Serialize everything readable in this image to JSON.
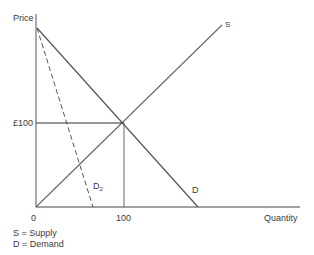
{
  "diagram": {
    "y_axis_label": "Price",
    "x_axis_label": "Quantity",
    "price_tick": "£100",
    "quantity_tick": "100",
    "origin": "0",
    "curves": {
      "supply": "S",
      "demand": "D",
      "demand2_main": "D",
      "demand2_sub": "2"
    },
    "legend": [
      "S = Supply",
      "D = Demand"
    ],
    "colors": {
      "line": "#555555",
      "axis": "#444444"
    }
  }
}
